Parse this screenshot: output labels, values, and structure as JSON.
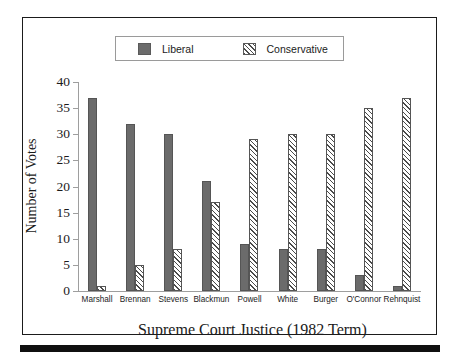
{
  "chart_data": {
    "type": "bar",
    "title": "",
    "xlabel": "Supreme Court Justice (1982 Term)",
    "ylabel": "Number of Votes",
    "categories": [
      "Marshall",
      "Brennan",
      "Stevens",
      "Blackmun",
      "Powell",
      "White",
      "Burger",
      "O'Connor",
      "Rehnquist"
    ],
    "series": [
      {
        "name": "Liberal",
        "values": [
          37,
          32,
          30,
          21,
          9,
          8,
          8,
          3,
          1
        ],
        "color": "#6b6b6b",
        "pattern": "solid"
      },
      {
        "name": "Conservative",
        "values": [
          1,
          5,
          8,
          17,
          29,
          30,
          30,
          35,
          37
        ],
        "color": "#4a4a4a",
        "pattern": "diagonal-hatch"
      }
    ],
    "ylim": [
      0,
      40
    ],
    "yticks": [
      0,
      5,
      10,
      15,
      20,
      25,
      30,
      35,
      40
    ],
    "ytick_labels": [
      "0",
      "5",
      "10",
      "15",
      "20",
      "25",
      "30",
      "35",
      "40"
    ],
    "grid": false,
    "legend_position": "top-center"
  },
  "legend": {
    "items": [
      {
        "label": "Liberal",
        "swatch": "solid-square-icon"
      },
      {
        "label": "Conservative",
        "swatch": "hatched-square-icon"
      }
    ]
  }
}
